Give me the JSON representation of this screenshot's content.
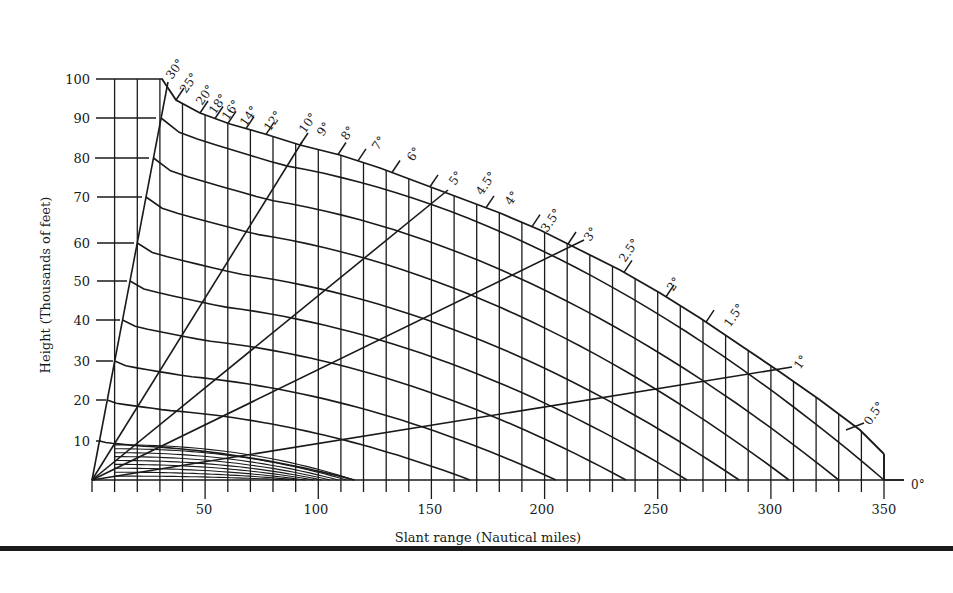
{
  "chart_data": {
    "type": "line",
    "title": "",
    "subtitle": "Radar coverage / height-range-angle chart",
    "xlabel": "Slant range (Nautical miles)",
    "ylabel": "Height (Thousands of feet)",
    "xlim": [
      0,
      350
    ],
    "ylim": [
      0,
      100
    ],
    "grid": true,
    "legend": "none",
    "x_ticks": [
      50,
      100,
      150,
      200,
      250,
      300,
      350
    ],
    "y_ticks": [
      10,
      20,
      30,
      40,
      50,
      60,
      70,
      80,
      90,
      100
    ],
    "elevation_angle_labels": [
      "30°",
      "25°",
      "20°",
      "18°",
      "16°",
      "14°",
      "12°",
      "10°",
      "9°",
      "8°",
      "7°",
      "6°",
      "5°",
      "4.5°",
      "4°",
      "3.5°",
      "3°",
      "2.5°",
      "2°",
      "1.5°",
      "1°",
      "0.5°",
      "0°"
    ],
    "drawn_elevation_rays_deg": [
      30,
      10,
      5,
      3,
      1,
      0
    ],
    "height_contours_kft": [
      10,
      20,
      30,
      40,
      50,
      60,
      70,
      80,
      90,
      100
    ],
    "height_contour_zero_crossing_range_nmi": {
      "10": 116,
      "20": 167,
      "30": 205,
      "40": 236,
      "50": 263,
      "60": 286,
      "70": 308,
      "80": 330,
      "90": 350
    },
    "low_altitude_contours_kft": [
      1,
      2,
      3,
      4,
      5,
      6,
      7,
      8,
      9
    ],
    "low_altitude_contours_max_range_nmi": 116,
    "vertical_gridline_spacing_nmi": 10,
    "top_boundary": "100,000 ft height contour, from ~31 nmi (30°) to 350 nmi (~0.5°)"
  },
  "axes": {
    "x_title": "Slant range (Nautical miles)",
    "y_title": "Height (Thousands of feet)",
    "x_tick_labels": [
      "50",
      "100",
      "150",
      "200",
      "250",
      "300",
      "350"
    ],
    "y_tick_labels": [
      "10",
      "20",
      "30",
      "40",
      "50",
      "60",
      "70",
      "80",
      "90",
      "100"
    ]
  },
  "angle_labels": {
    "a30": "30°",
    "a25": "25°",
    "a20": "20°",
    "a18": "18°",
    "a16": "16°",
    "a14": "14°",
    "a12": "12°",
    "a10": "10°",
    "a9": "9°",
    "a8": "8°",
    "a7": "7°",
    "a6": "6°",
    "a5": "5°",
    "a45": "4.5°",
    "a4": "4°",
    "a35": "3.5°",
    "a3": "3°",
    "a25b": "2.5°",
    "a2": "2°",
    "a15": "1.5°",
    "a1": "1°",
    "a05": "0.5°",
    "a0": "0°"
  },
  "colors": {
    "ink": "#1a1a1a",
    "background": "#ffffff"
  }
}
